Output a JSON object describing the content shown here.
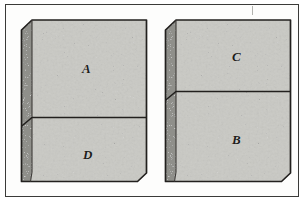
{
  "figure": {
    "kind": "line-drawing",
    "frame": {
      "border_color": "#3a3a38",
      "background": "#fdfdfc"
    },
    "artifact_mark": "tick-mark"
  },
  "palette": {
    "block_face": "#c9c9c4",
    "block_face_dark": "#bdbdb7",
    "block_side": "#8f8f8a",
    "block_side_dark": "#7d7d78",
    "outline": "#22201e",
    "label_color": "#1d1d1b",
    "frame_border": "#3a3a38",
    "paper": "#ffffff"
  },
  "blocks": [
    {
      "id": "left-block",
      "name": "left-block",
      "segments": [
        {
          "id": "segment-a",
          "label": "A",
          "position": "top"
        },
        {
          "id": "segment-d",
          "label": "D",
          "position": "bottom"
        }
      ]
    },
    {
      "id": "right-block",
      "name": "right-block",
      "segments": [
        {
          "id": "segment-c",
          "label": "C",
          "position": "top"
        },
        {
          "id": "segment-b",
          "label": "B",
          "position": "bottom"
        }
      ]
    }
  ],
  "labels": {
    "a": "A",
    "b": "B",
    "c": "C",
    "d": "D"
  }
}
